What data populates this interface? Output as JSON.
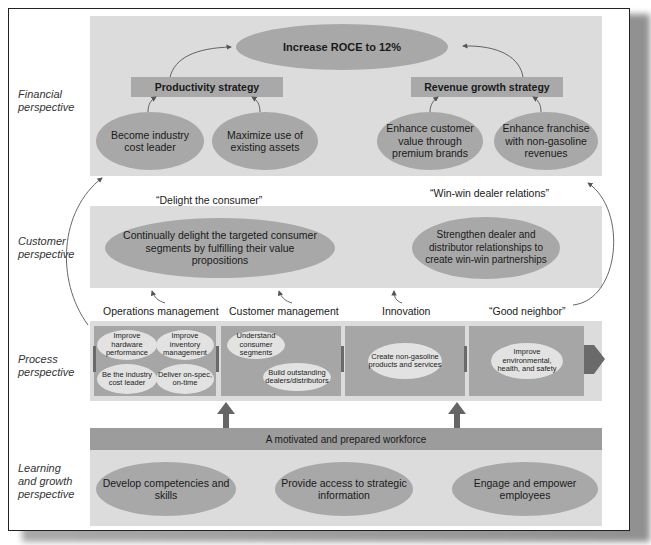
{
  "perspectives": {
    "financial": "Financial\nperspective",
    "customer": "Customer\nperspective",
    "process": "Process\nperspective",
    "learning": "Learning\nand growth\nperspective"
  },
  "financial": {
    "goal": "Increase ROCE to 12%",
    "productivity_strategy": "Productivity strategy",
    "revenue_strategy": "Revenue growth strategy",
    "objectives": [
      "Become industry cost leader",
      "Maximize use of existing assets",
      "Enhance customer value through premium brands",
      "Enhance franchise with non-gasoline revenues"
    ]
  },
  "customer": {
    "theme_left": "“Delight the consumer”",
    "theme_right": "“Win-win dealer relations”",
    "objectives": [
      "Continually delight the targeted consumer segments by fulfilling their value propositions",
      "Strengthen dealer and distributor relationships to create win-win partnerships"
    ]
  },
  "process": {
    "headers": [
      "Operations management",
      "Customer management",
      "Innovation",
      "“Good neighbor”"
    ],
    "operations": [
      "Improve hardware performance",
      "Improve inventory management",
      "Be the industry cost leader",
      "Deliver on-spec, on-time"
    ],
    "customer_mgmt": [
      "Understand consumer segments",
      "Build outstanding dealers/distributors"
    ],
    "innovation": [
      "Create non-gasoline products and services"
    ],
    "good_neighbor": [
      "Improve environmental, health, and safety"
    ]
  },
  "learning": {
    "workforce": "A motivated and prepared workforce",
    "objectives": [
      "Develop competencies and skills",
      "Provide access to strategic information",
      "Engage and empower employees"
    ]
  },
  "colors": {
    "band": "#dcdcdc",
    "ellipse": "#a8a8a8",
    "process_cell": "#a6a6a6",
    "mini_ellipse": "#e2e2e2",
    "workforce_bar": "#9c9c9c",
    "arrow": "#555555"
  }
}
